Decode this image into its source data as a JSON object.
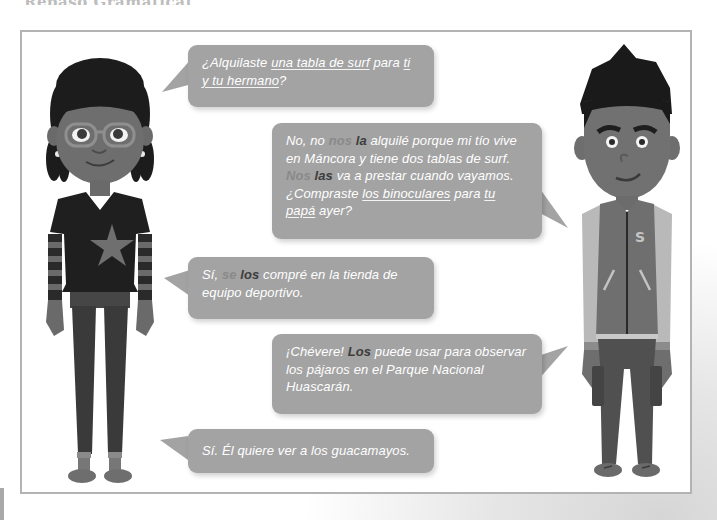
{
  "page": {
    "heading_partial": "Repaso Gramatical"
  },
  "colors": {
    "bubble_bg": "#a3a3a3",
    "bubble_text": "#ffffff",
    "pronoun_indirect": "#8a8a8a",
    "pronoun_direct": "#3d3d3d",
    "frame_border": "#b3b3b3"
  },
  "characters": {
    "left": {
      "name": "girl",
      "description": "Girl with braids, glasses, dark star shirt, striped sleeves"
    },
    "right": {
      "name": "boy",
      "description": "Boy with spiky hair, varsity jacket with letter S, cargo pants",
      "jacket_letter": "S"
    }
  },
  "dialogue": [
    {
      "speaker": "left",
      "segments": [
        {
          "text": "¿Alquilaste ",
          "style": "plain"
        },
        {
          "text": "una tabla de surf",
          "style": "underline"
        },
        {
          "text": " para ",
          "style": "plain"
        },
        {
          "text": "ti y tu hermano",
          "style": "underline"
        },
        {
          "text": "?",
          "style": "plain"
        }
      ]
    },
    {
      "speaker": "right",
      "segments": [
        {
          "text": "No, no ",
          "style": "plain"
        },
        {
          "text": "nos",
          "style": "indirect"
        },
        {
          "text": " ",
          "style": "plain"
        },
        {
          "text": "la",
          "style": "direct"
        },
        {
          "text": " alquilé porque mi tío vive en Máncora y tiene dos tablas de surf. ",
          "style": "plain"
        },
        {
          "text": "Nos",
          "style": "indirect"
        },
        {
          "text": " ",
          "style": "plain"
        },
        {
          "text": "las",
          "style": "direct"
        },
        {
          "text": " va a prestar cuando vayamos. ¿Compraste ",
          "style": "plain"
        },
        {
          "text": "los binoculares",
          "style": "underline"
        },
        {
          "text": " para ",
          "style": "plain"
        },
        {
          "text": "tu papá",
          "style": "underline"
        },
        {
          "text": " ayer?",
          "style": "plain"
        }
      ]
    },
    {
      "speaker": "left",
      "segments": [
        {
          "text": "Sí, ",
          "style": "plain"
        },
        {
          "text": "se",
          "style": "indirect"
        },
        {
          "text": " ",
          "style": "plain"
        },
        {
          "text": "los",
          "style": "direct"
        },
        {
          "text": " compré en la tienda de equipo deportivo.",
          "style": "plain"
        }
      ]
    },
    {
      "speaker": "right",
      "segments": [
        {
          "text": "¡Chévere! ",
          "style": "plain"
        },
        {
          "text": "Los",
          "style": "direct"
        },
        {
          "text": " puede usar para observar los pájaros en el Parque Nacional Huascarán.",
          "style": "plain"
        }
      ]
    },
    {
      "speaker": "left",
      "segments": [
        {
          "text": "Sí. Él quiere ver a los guacamayos.",
          "style": "plain"
        }
      ]
    }
  ]
}
